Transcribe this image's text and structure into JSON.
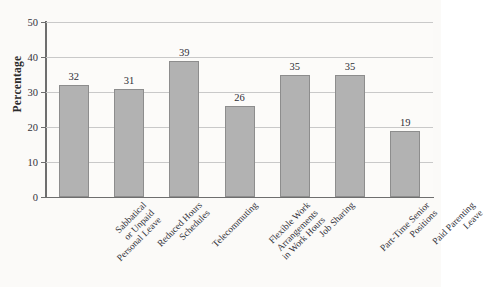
{
  "figure": {
    "background_color": "#fbfaf8",
    "bar_color": "#b2b2b2",
    "bar_edge_color": "#8d8d8d",
    "grid_color": "#c9c9c9",
    "axis_color": "#6e6e6e"
  },
  "title_strip": {
    "text": "",
    "note": "cut-off title row at top of screenshot"
  },
  "chart_data": {
    "type": "bar",
    "title": "",
    "xlabel": "",
    "ylabel": "Percentage",
    "ylim": [
      0,
      50
    ],
    "yticks": [
      0,
      10,
      20,
      30,
      40,
      50
    ],
    "grid": true,
    "legend": null,
    "categories": [
      "Sabbatical or Unpaid Personal Leave",
      "Reduced Hours Schedules",
      "Telecommuting",
      "Flexible Work Arrangements in Work Hours",
      "Job Sharing",
      "Part-Time Senior Positions",
      "Paid Parenting Leave"
    ],
    "category_lines": [
      [
        "Sabbatical",
        "or Unpaid",
        "Personal Leave"
      ],
      [
        "Reduced Hours",
        "Schedules"
      ],
      [
        "Telecommuting"
      ],
      [
        "Flexible Work",
        "Arrangements",
        "in Work Hours"
      ],
      [
        "Job Sharing"
      ],
      [
        "Part-Time Senior",
        "Positions"
      ],
      [
        "Paid Parenting",
        "Leave"
      ]
    ],
    "values": [
      32,
      31,
      39,
      26,
      35,
      35,
      19
    ],
    "value_labels": [
      "32",
      "31",
      "39",
      "26",
      "35",
      "35",
      "19"
    ],
    "ytick_labels": [
      "0",
      "10",
      "20",
      "30",
      "40",
      "50"
    ]
  }
}
